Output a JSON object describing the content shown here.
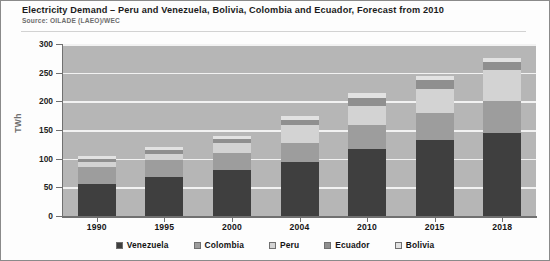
{
  "header": {
    "title": "Electricity Demand – Peru and Venezuela, Bolivia, Colombia and Ecuador, Forecast from 2010",
    "source": "Source:  OILADE (LAEO)/WEC"
  },
  "chart_data": {
    "type": "bar",
    "stacked": true,
    "title": "Electricity Demand – Peru and Venezuela, Bolivia, Colombia and Ecuador, Forecast from 2010",
    "subtitle": "Source:  OILADE (LAEO)/WEC",
    "xlabel": "",
    "ylabel": "TWh",
    "categories": [
      "1990",
      "1995",
      "2000",
      "2004",
      "2010",
      "2015",
      "2018"
    ],
    "ylim": [
      0,
      300
    ],
    "yticks": [
      0,
      50,
      100,
      150,
      200,
      250,
      300
    ],
    "ytick_labels": [
      "0",
      "50",
      "100",
      "150",
      "200",
      "250",
      "300"
    ],
    "grid": true,
    "legend_position": "bottom",
    "series": [
      {
        "name": "Venezuela",
        "color": "#3f3f3f",
        "values": [
          55,
          68,
          80,
          95,
          117,
          133,
          145
        ]
      },
      {
        "name": "Colombia",
        "color": "#9d9d9d",
        "values": [
          30,
          30,
          30,
          33,
          41,
          47,
          55
        ]
      },
      {
        "name": "Peru",
        "color": "#d3d3d3",
        "values": [
          10,
          11,
          18,
          30,
          34,
          42,
          55
        ]
      },
      {
        "name": "Ecuador",
        "color": "#8f8f8f",
        "values": [
          5,
          6,
          7,
          10,
          14,
          16,
          13
        ]
      },
      {
        "name": "Bolivia",
        "color": "#e2e2e2",
        "values": [
          5,
          5,
          5,
          7,
          9,
          7,
          7
        ]
      }
    ],
    "totals": [
      105,
      120,
      140,
      175,
      215,
      245,
      275
    ]
  },
  "legend": {
    "items": [
      {
        "label": "Venezuela",
        "color": "#3f3f3f"
      },
      {
        "label": "Colombia",
        "color": "#9d9d9d"
      },
      {
        "label": "Peru",
        "color": "#d3d3d3"
      },
      {
        "label": "Ecuador",
        "color": "#8f8f8f"
      },
      {
        "label": "Bolivia",
        "color": "#e2e2e2"
      }
    ]
  }
}
